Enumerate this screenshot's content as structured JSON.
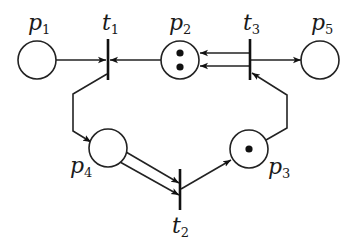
{
  "diagram": {
    "type": "petri-net",
    "colors": {
      "stroke": "#222222",
      "background": "#ffffff",
      "token": "#111111"
    },
    "places": [
      {
        "id": "p1",
        "name": "p",
        "sub": "1",
        "tokens": 0
      },
      {
        "id": "p2",
        "name": "p",
        "sub": "2",
        "tokens": 2
      },
      {
        "id": "p3",
        "name": "p",
        "sub": "3",
        "tokens": 1
      },
      {
        "id": "p4",
        "name": "p",
        "sub": "4",
        "tokens": 0
      },
      {
        "id": "p5",
        "name": "p",
        "sub": "5",
        "tokens": 0
      }
    ],
    "transitions": [
      {
        "id": "t1",
        "name": "t",
        "sub": "1"
      },
      {
        "id": "t2",
        "name": "t",
        "sub": "2"
      },
      {
        "id": "t3",
        "name": "t",
        "sub": "3"
      }
    ],
    "arcs": [
      {
        "from": "p1",
        "to": "t1",
        "weight": 1
      },
      {
        "from": "p2",
        "to": "t1",
        "weight": 1
      },
      {
        "from": "t1",
        "to": "p4",
        "weight": 1
      },
      {
        "from": "p4",
        "to": "t2",
        "weight": 2
      },
      {
        "from": "t2",
        "to": "p3",
        "weight": 1
      },
      {
        "from": "p3",
        "to": "t3",
        "weight": 1
      },
      {
        "from": "t3",
        "to": "p2",
        "weight": 2
      },
      {
        "from": "t3",
        "to": "p5",
        "weight": 1
      }
    ]
  }
}
